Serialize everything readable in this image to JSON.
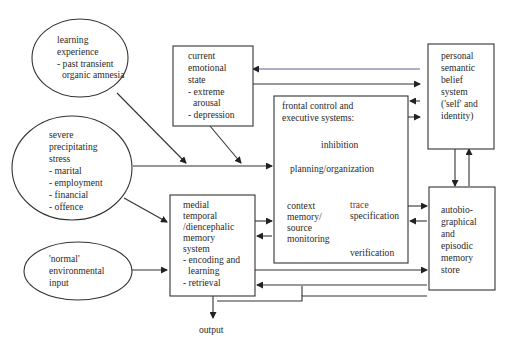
{
  "diagram": {
    "nodes": {
      "learning": {
        "lines": [
          "learning",
          "experience",
          "- past transient",
          "  organic amnesia"
        ]
      },
      "stress": {
        "lines": [
          "severe",
          "precipitating",
          "stress",
          "- marital",
          "- employment",
          "- financial",
          "- offence"
        ]
      },
      "normal": {
        "lines": [
          "'normal'",
          "environmental",
          "input"
        ]
      },
      "emotional": {
        "lines": [
          "current",
          "emotional",
          "state",
          "- extreme",
          "  arousal",
          "- depression"
        ]
      },
      "frontal": {
        "title_lines": [
          "frontal control and",
          "executive systems:"
        ],
        "inhibition": "inhibition",
        "planning": "planning/organization",
        "context_lines": [
          "context",
          "memory/",
          "source",
          "monitoring"
        ],
        "trace_lines": [
          "trace",
          "specification"
        ],
        "verification": "verification"
      },
      "medial": {
        "lines": [
          "medial",
          "temporal",
          "/diencephalic",
          "memory",
          "system",
          "- encoding and",
          "  learning",
          "- retrieval"
        ]
      },
      "semantic": {
        "lines": [
          "personal",
          "semantic",
          "belief",
          "system",
          "('self' and",
          "identity)"
        ]
      },
      "autobio": {
        "lines": [
          "autobio-",
          "graphical",
          "and",
          "episodic",
          "memory",
          "store"
        ]
      },
      "output": {
        "label": "output"
      }
    },
    "colors": {
      "stroke": "#333333",
      "text": "#2a2a2a",
      "accent_line": "#6d5a9c",
      "trace_text": "#7a2c2c"
    }
  }
}
